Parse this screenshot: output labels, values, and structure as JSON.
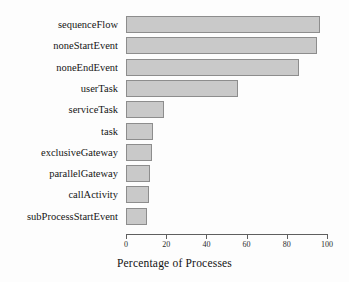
{
  "chart_data": {
    "type": "bar",
    "orientation": "horizontal",
    "title": "",
    "xlabel": "Percentage of Processes",
    "ylabel": "",
    "categories": [
      "sequenceFlow",
      "noneStartEvent",
      "noneEndEvent",
      "userTask",
      "serviceTask",
      "task",
      "exclusiveGateway",
      "parallelGateway",
      "callActivity",
      "subProcessStartEvent"
    ],
    "values": [
      96.5,
      95,
      86,
      55.5,
      19,
      13.5,
      13,
      12,
      11.5,
      10.5
    ],
    "xlim": [
      0,
      100
    ],
    "xticks": [
      0,
      20,
      40,
      60,
      80,
      100
    ],
    "xtick_labels": [
      "0",
      "20",
      "40",
      "60",
      "80",
      "100"
    ],
    "grid": false,
    "legend": null,
    "bar_fill_color": "#c9c9c9",
    "bar_border_color": "#8d8d8d",
    "axis_color": "#5f5f5f",
    "background_color": "#fdfdfd"
  }
}
